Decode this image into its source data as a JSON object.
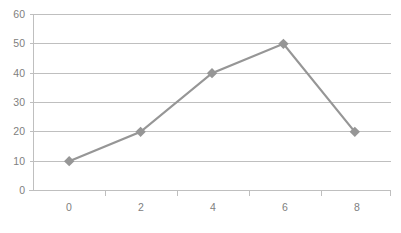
{
  "chart_data": {
    "type": "line",
    "title": "",
    "subtitle": "",
    "xlabel": "",
    "ylabel": "",
    "x": [
      0,
      2,
      4,
      6,
      8
    ],
    "values": [
      10,
      20,
      40,
      50,
      20
    ],
    "series": [
      {
        "name": "Series 1",
        "x": [
          0,
          2,
          4,
          6,
          8
        ],
        "values": [
          10,
          20,
          40,
          50,
          20
        ]
      }
    ],
    "xlim": [
      -1,
      9
    ],
    "ylim": [
      0,
      60
    ],
    "x_tick_labels": [
      "0",
      "2",
      "4",
      "6",
      "8"
    ],
    "y_tick_labels": [
      "0",
      "10",
      "20",
      "30",
      "40",
      "50",
      "60"
    ],
    "y_ticks": [
      0,
      10,
      20,
      30,
      40,
      50,
      60
    ],
    "grid": "horizontal",
    "legend": "none",
    "marker": "diamond",
    "colors": {
      "series": "#969696",
      "gridline": "#bfbfbf",
      "axis": "#bfbfbf",
      "tick_text": "#808080",
      "background": "#ffffff"
    }
  }
}
